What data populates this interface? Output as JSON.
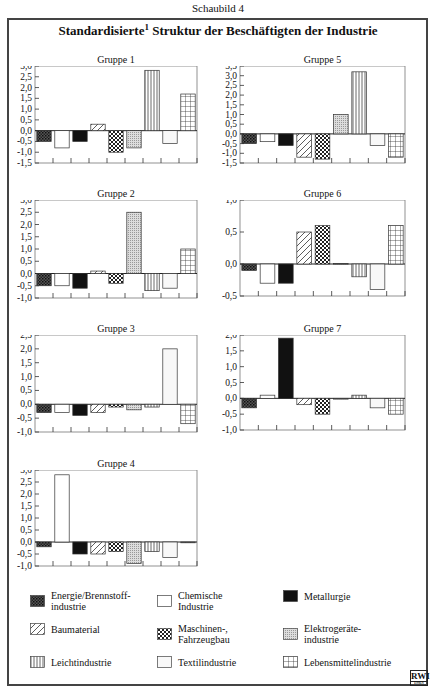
{
  "caption": "Schaubild 4",
  "title": {
    "main_pre": "Standardisierte",
    "superscript": "1",
    "main_post": "Struktur der Beschäftigten der Industrie"
  },
  "logo": {
    "text": "RWI",
    "subtext": "ESSEN"
  },
  "legend": [
    {
      "key": "energie",
      "label_line1": "Energie/Brennstoff-",
      "label_line2": "industrie",
      "pattern": "dense-check"
    },
    {
      "key": "chemie",
      "label_line1": "Chemische",
      "label_line2": "Industrie",
      "pattern": "white"
    },
    {
      "key": "metall",
      "label_line1": "Metallurgie",
      "label_line2": "",
      "pattern": "black"
    },
    {
      "key": "bau",
      "label_line1": "Baumaterial",
      "label_line2": "",
      "pattern": "diagonal"
    },
    {
      "key": "maschinen",
      "label_line1": "Maschinen-,",
      "label_line2": "Fahrzeugbau",
      "pattern": "crosshatch"
    },
    {
      "key": "elektro",
      "label_line1": "Elektrogeräte-",
      "label_line2": "industrie",
      "pattern": "dotted-gray"
    },
    {
      "key": "leicht",
      "label_line1": "Leichtindustrie",
      "label_line2": "",
      "pattern": "vertical"
    },
    {
      "key": "textil",
      "label_line1": "Textilindustrie",
      "label_line2": "",
      "pattern": "light"
    },
    {
      "key": "lebensmittel",
      "label_line1": "Lebensmittelindustrie",
      "label_line2": "",
      "pattern": "grid"
    }
  ],
  "chart_data": [
    {
      "type": "bar",
      "title": "Gruppe 1",
      "categories": [
        "Energie/Brennstoffindustrie",
        "Chemische Industrie",
        "Metallurgie",
        "Baumaterial",
        "Maschinen-, Fahrzeugbau",
        "Elektrogeräteindustrie",
        "Leichtindustrie",
        "Textilindustrie",
        "Lebensmittelindustrie"
      ],
      "values": [
        -0.5,
        -0.8,
        -0.5,
        0.3,
        -1.0,
        -0.8,
        2.8,
        -0.6,
        1.7
      ],
      "ylim": [
        -1.5,
        3.0
      ],
      "yticks": [
        "3,0",
        "2,5",
        "2,0",
        "1,5",
        "1,0",
        "0,5",
        "0,0",
        "-0,5",
        "-1,0",
        "-1,5"
      ],
      "step": 0.5
    },
    {
      "type": "bar",
      "title": "Gruppe 5",
      "categories": [
        "Energie/Brennstoffindustrie",
        "Chemische Industrie",
        "Metallurgie",
        "Baumaterial",
        "Maschinen-, Fahrzeugbau",
        "Elektrogeräteindustrie",
        "Leichtindustrie",
        "Textilindustrie",
        "Lebensmittelindustrie"
      ],
      "values": [
        -0.5,
        -0.4,
        -0.6,
        -1.2,
        -1.3,
        1.0,
        3.2,
        -0.6,
        -1.2
      ],
      "ylim": [
        -1.5,
        3.5
      ],
      "yticks": [
        "3,5",
        "3,0",
        "2,5",
        "2,0",
        "1,5",
        "1,0",
        "0,5",
        "0,0",
        "-0,5",
        "-1,0",
        "-1,5"
      ],
      "step": 0.5
    },
    {
      "type": "bar",
      "title": "Gruppe 2",
      "categories": [
        "Energie/Brennstoffindustrie",
        "Chemische Industrie",
        "Metallurgie",
        "Baumaterial",
        "Maschinen-, Fahrzeugbau",
        "Elektrogeräteindustrie",
        "Leichtindustrie",
        "Textilindustrie",
        "Lebensmittelindustrie"
      ],
      "values": [
        -0.5,
        -0.5,
        -0.6,
        0.1,
        -0.4,
        2.5,
        -0.7,
        -0.6,
        1.0
      ],
      "ylim": [
        -1.0,
        3.0
      ],
      "yticks": [
        "3,0",
        "2,5",
        "2,0",
        "1,5",
        "1,0",
        "0,5",
        "0,0",
        "-0,5",
        "-1,0"
      ],
      "step": 0.5
    },
    {
      "type": "bar",
      "title": "Gruppe 6",
      "categories": [
        "Energie/Brennstoffindustrie",
        "Chemische Industrie",
        "Metallurgie",
        "Baumaterial",
        "Maschinen-, Fahrzeugbau",
        "Elektrogeräteindustrie",
        "Leichtindustrie",
        "Textilindustrie",
        "Lebensmittelindustrie"
      ],
      "values": [
        -0.1,
        -0.3,
        -0.3,
        0.5,
        0.6,
        0.01,
        -0.2,
        -0.4,
        0.6
      ],
      "ylim": [
        -0.5,
        1.0
      ],
      "yticks": [
        "1,0",
        "0,5",
        "0,0",
        "-0,5"
      ],
      "step": 0.5
    },
    {
      "type": "bar",
      "title": "Gruppe 3",
      "categories": [
        "Energie/Brennstoffindustrie",
        "Chemische Industrie",
        "Metallurgie",
        "Baumaterial",
        "Maschinen-, Fahrzeugbau",
        "Elektrogeräteindustrie",
        "Leichtindustrie",
        "Textilindustrie",
        "Lebensmittelindustrie"
      ],
      "values": [
        -0.3,
        -0.3,
        -0.4,
        -0.3,
        -0.1,
        -0.2,
        -0.1,
        2.0,
        -0.7
      ],
      "ylim": [
        -1.0,
        2.5
      ],
      "yticks": [
        "2,5",
        "2,0",
        "1,5",
        "1,0",
        "0,5",
        "0,0",
        "-0,5",
        "-1,0"
      ],
      "step": 0.5
    },
    {
      "type": "bar",
      "title": "Gruppe 7",
      "categories": [
        "Energie/Brennstoffindustrie",
        "Chemische Industrie",
        "Metallurgie",
        "Baumaterial",
        "Maschinen-, Fahrzeugbau",
        "Elektrogeräteindustrie",
        "Leichtindustrie",
        "Textilindustrie",
        "Lebensmittelindustrie"
      ],
      "values": [
        -0.3,
        0.1,
        1.9,
        -0.2,
        -0.5,
        0.0,
        0.1,
        -0.3,
        -0.5
      ],
      "ylim": [
        -1.0,
        2.0
      ],
      "yticks": [
        "2,0",
        "1,5",
        "1,0",
        "0,5",
        "0,0",
        "-0,5",
        "-1,0"
      ],
      "step": 0.5
    },
    {
      "type": "bar",
      "title": "Gruppe 4",
      "categories": [
        "Energie/Brennstoffindustrie",
        "Chemische Industrie",
        "Metallurgie",
        "Baumaterial",
        "Maschinen-, Fahrzeugbau",
        "Elektrogeräteindustrie",
        "Leichtindustrie",
        "Textilindustrie",
        "Lebensmittelindustrie"
      ],
      "values": [
        -0.2,
        2.8,
        -0.5,
        -0.5,
        -0.4,
        -0.9,
        -0.4,
        -0.65,
        0.0
      ],
      "ylim": [
        -1.0,
        3.0
      ],
      "yticks": [
        "3,0",
        "2,5",
        "2,0",
        "1,5",
        "1,0",
        "0,5",
        "0,0",
        "-0,5",
        "-1,0"
      ],
      "step": 0.5
    }
  ]
}
